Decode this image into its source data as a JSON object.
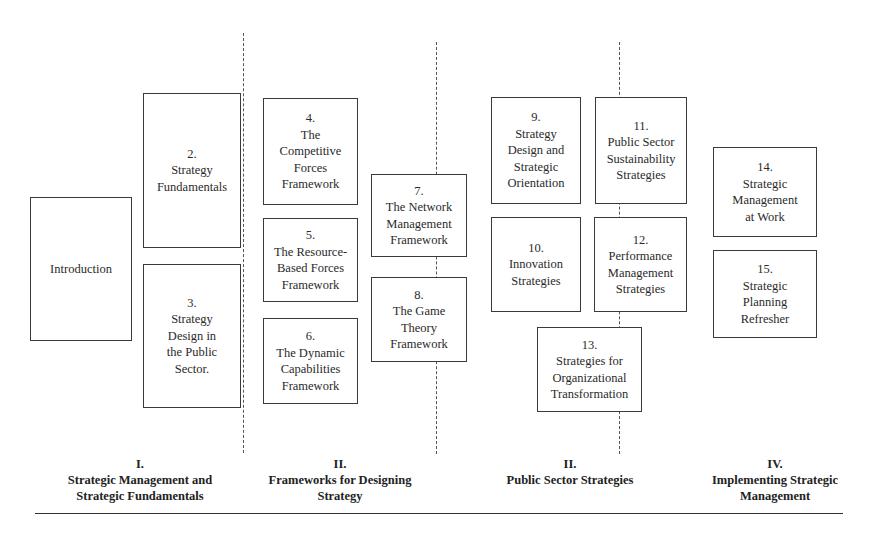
{
  "boxes": {
    "intro": {
      "num": "",
      "lines": [
        "Introduction"
      ]
    },
    "b2": {
      "num": "2.",
      "lines": [
        "Strategy",
        "Fundamentals"
      ]
    },
    "b3": {
      "num": "3.",
      "lines": [
        "Strategy",
        "Design in",
        "the Public",
        "Sector."
      ]
    },
    "b4": {
      "num": "4.",
      "lines": [
        "The",
        "Competitive",
        "Forces",
        "Framework"
      ]
    },
    "b5": {
      "num": "5.",
      "lines": [
        "The Resource-",
        "Based Forces",
        "Framework"
      ]
    },
    "b6": {
      "num": "6.",
      "lines": [
        "The Dynamic",
        "Capabilities",
        "Framework"
      ]
    },
    "b7": {
      "num": "7.",
      "lines": [
        "The Network",
        "Management",
        "Framework"
      ]
    },
    "b8": {
      "num": "8.",
      "lines": [
        "The Game",
        "Theory",
        "Framework"
      ]
    },
    "b9": {
      "num": "9.",
      "lines": [
        "Strategy",
        "Design and",
        "Strategic",
        "Orientation"
      ]
    },
    "b10": {
      "num": "10.",
      "lines": [
        "Innovation",
        "Strategies"
      ]
    },
    "b11": {
      "num": "11.",
      "lines": [
        "Public Sector",
        "Sustainability",
        "Strategies"
      ]
    },
    "b12": {
      "num": "12.",
      "lines": [
        "Performance",
        "Management",
        "Strategies"
      ]
    },
    "b13": {
      "num": "13.",
      "lines": [
        "Strategies for",
        "Organizational",
        "Transformation"
      ]
    },
    "b14": {
      "num": "14.",
      "lines": [
        "Strategic",
        "Management",
        "at Work"
      ]
    },
    "b15": {
      "num": "15.",
      "lines": [
        "Strategic",
        "Planning",
        "Refresher"
      ]
    }
  },
  "sections": [
    {
      "numeral": "I.",
      "lines": [
        "Strategic Management and",
        "Strategic Fundamentals"
      ]
    },
    {
      "numeral": "II.",
      "lines": [
        "Frameworks for Designing",
        "Strategy"
      ]
    },
    {
      "numeral": "II.",
      "lines": [
        "Public Sector Strategies"
      ]
    },
    {
      "numeral": "IV.",
      "lines": [
        "Implementing Strategic",
        "Management"
      ]
    }
  ]
}
